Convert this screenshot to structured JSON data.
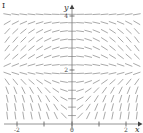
{
  "figure": {
    "label": "I",
    "caption": "",
    "background_color": "#ffffff"
  },
  "axes": {
    "x_axis": {
      "name": "x-axis",
      "label": "x",
      "arrow": true,
      "pixel_y": 124,
      "range": [
        -3,
        3
      ],
      "ticks": [
        {
          "value": -2,
          "label": "-2",
          "pixel_x": 17
        },
        {
          "value": -1,
          "label": "",
          "pixel_x": 44
        },
        {
          "value": 0,
          "label": "0",
          "pixel_x": 72
        },
        {
          "value": 1,
          "label": "",
          "pixel_x": 99
        },
        {
          "value": 2,
          "label": "2",
          "pixel_x": 126
        }
      ]
    },
    "y_axis": {
      "name": "y-axis",
      "label": "y",
      "arrow": true,
      "pixel_x": 72,
      "range": [
        0,
        5
      ],
      "ticks": [
        {
          "value": 2,
          "label": "2",
          "pixel_y": 70
        },
        {
          "value": 4,
          "label": "4",
          "pixel_y": 16
        }
      ]
    },
    "axis_color": "#7a7a7a",
    "tick_color": "#555555"
  },
  "chart_data": {
    "type": "slope-field",
    "title": "",
    "xlabel": "x",
    "ylabel": "y",
    "xlim": [
      -3.0,
      3.0
    ],
    "ylim": [
      0.0,
      5.0
    ],
    "grid": false,
    "legend": "none",
    "segment_color": "#9a9a9a",
    "segment_length_px": 7,
    "equilibrium_lines": [
      {
        "y": 2,
        "stability": "attracting",
        "note": "segments horizontal at y = 2"
      },
      {
        "y": 4,
        "stability": "repelling",
        "note": "segments horizontal near y = 4"
      }
    ],
    "grid_points": {
      "nx": 21,
      "ny": 17
    },
    "slope_rule_description": "dy/dx = (y-2)(4-y)*x-like behaviour: slopes flatten on y=2 and y=4, tilt upward for x>0 between the lines and downward for x<0",
    "samples": [
      {
        "x": -2.5,
        "y": 4.5,
        "slope": 2.2
      },
      {
        "x": -1.5,
        "y": 4.5,
        "slope": 1.7
      },
      {
        "x": -0.5,
        "y": 4.5,
        "slope": 0.6
      },
      {
        "x": 0.5,
        "y": 4.5,
        "slope": -0.6
      },
      {
        "x": 1.5,
        "y": 4.5,
        "slope": -1.7
      },
      {
        "x": 2.5,
        "y": 4.5,
        "slope": -2.2
      },
      {
        "x": -2.5,
        "y": 4.0,
        "slope": 0.15
      },
      {
        "x": 0.0,
        "y": 4.0,
        "slope": 0.0
      },
      {
        "x": 2.5,
        "y": 4.0,
        "slope": -0.15
      },
      {
        "x": -2.5,
        "y": 3.0,
        "slope": -1.3
      },
      {
        "x": -1.0,
        "y": 3.0,
        "slope": -0.7
      },
      {
        "x": 1.0,
        "y": 3.0,
        "slope": 0.7
      },
      {
        "x": 2.5,
        "y": 3.0,
        "slope": 1.3
      },
      {
        "x": -2.5,
        "y": 2.0,
        "slope": 0.0
      },
      {
        "x": 0.0,
        "y": 2.0,
        "slope": 0.0
      },
      {
        "x": 2.5,
        "y": 2.0,
        "slope": 0.0
      },
      {
        "x": -2.5,
        "y": 1.0,
        "slope": 1.4
      },
      {
        "x": -1.0,
        "y": 1.0,
        "slope": 0.8
      },
      {
        "x": 1.0,
        "y": 1.0,
        "slope": -0.8
      },
      {
        "x": 2.5,
        "y": 1.0,
        "slope": -1.4
      },
      {
        "x": -2.5,
        "y": 0.2,
        "slope": 2.3
      },
      {
        "x": 0.0,
        "y": 0.2,
        "slope": 0.0
      },
      {
        "x": 2.5,
        "y": 0.2,
        "slope": -2.3
      }
    ]
  }
}
